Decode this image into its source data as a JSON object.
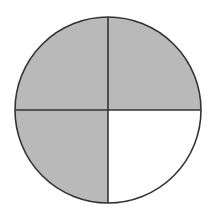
{
  "diagram": {
    "type": "fraction-circle",
    "total_parts": 4,
    "shaded_parts": 3,
    "parts": [
      {
        "position": "top-left",
        "shaded": true
      },
      {
        "position": "top-right",
        "shaded": true
      },
      {
        "position": "bottom-left",
        "shaded": true
      },
      {
        "position": "bottom-right",
        "shaded": false
      }
    ],
    "colors": {
      "shaded": "#b9b9b9",
      "unshaded": "#ffffff",
      "stroke": "#333333"
    }
  }
}
